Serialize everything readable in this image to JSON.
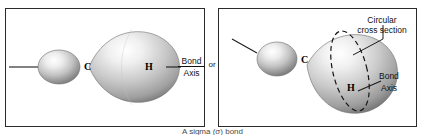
{
  "figure": {
    "caption": "A sigma (σ) bond",
    "connector_label": "or"
  },
  "panels": [
    {
      "id": "side-view",
      "atoms": [
        {
          "symbol": "C",
          "role": "carbon-sp3-orbital-label"
        },
        {
          "symbol": "H",
          "role": "hydrogen-s-orbital-label"
        }
      ],
      "annotations": [
        {
          "id": "bond-axis",
          "line1": "Bond",
          "line2": "Axis"
        }
      ]
    },
    {
      "id": "perspective-view",
      "atoms": [
        {
          "symbol": "C",
          "role": "carbon-sp3-orbital-label"
        },
        {
          "symbol": "H",
          "role": "hydrogen-s-orbital-label"
        }
      ],
      "annotations": [
        {
          "id": "cross-section",
          "line1": "Circular",
          "line2": "cross section"
        },
        {
          "id": "bond-axis",
          "line1": "Bond",
          "line2": "Axis"
        }
      ]
    }
  ],
  "colors": {
    "border": "#2b2b2b",
    "lobe_light": "#ffffff",
    "lobe_mid": "#c9c9c9",
    "lobe_dark": "#8a8a8a",
    "lobe_shadow": "#6e6e6e",
    "text": "#111111",
    "caption_text": "#4a4a4a"
  }
}
